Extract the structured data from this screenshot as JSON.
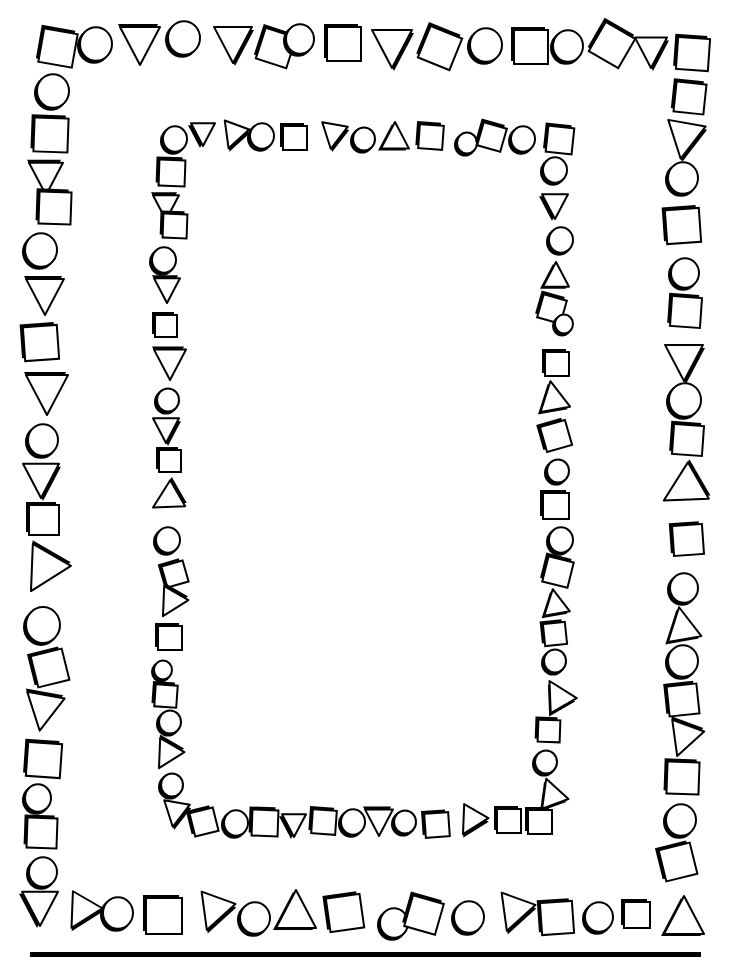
{
  "colors": {
    "ink": "#000000",
    "paper": "#ffffff"
  },
  "bottom_rule": {
    "x1": 30,
    "x2": 701,
    "y": 954,
    "thickness": 5
  },
  "outer_border": {
    "top": [
      {
        "t": "sq",
        "x": 58,
        "y": 48,
        "s": 34,
        "r": 10
      },
      {
        "t": "ci",
        "x": 96,
        "y": 44,
        "s": 34,
        "r": 0
      },
      {
        "t": "tr",
        "x": 140,
        "y": 45,
        "s": 40,
        "r": 90
      },
      {
        "t": "ci",
        "x": 184,
        "y": 38,
        "s": 34,
        "r": 0
      },
      {
        "t": "tl",
        "x": 233,
        "y": 44,
        "s": 38,
        "r": -90
      },
      {
        "t": "sq",
        "x": 276,
        "y": 48,
        "s": 32,
        "r": 18
      },
      {
        "t": "ci",
        "x": 300,
        "y": 39,
        "s": 30,
        "r": 0
      },
      {
        "t": "sq",
        "x": 344,
        "y": 44,
        "s": 34,
        "r": 0
      },
      {
        "t": "tl",
        "x": 392,
        "y": 48,
        "s": 40,
        "r": -90
      },
      {
        "t": "sq",
        "x": 440,
        "y": 48,
        "s": 34,
        "r": 22
      },
      {
        "t": "ci",
        "x": 486,
        "y": 45,
        "s": 34,
        "r": 0
      },
      {
        "t": "sq",
        "x": 531,
        "y": 47,
        "s": 34,
        "r": 0
      },
      {
        "t": "ci",
        "x": 568,
        "y": 46,
        "s": 32,
        "r": 0
      },
      {
        "t": "sq",
        "x": 612,
        "y": 45,
        "s": 34,
        "r": 30
      },
      {
        "t": "tl",
        "x": 651,
        "y": 52,
        "s": 32,
        "r": -90
      },
      {
        "t": "sq",
        "x": 693,
        "y": 54,
        "s": 32,
        "r": 4
      }
    ],
    "left": [
      {
        "t": "ci",
        "x": 53,
        "y": 91,
        "s": 34
      },
      {
        "t": "sq",
        "x": 51,
        "y": 135,
        "s": 34,
        "r": 2
      },
      {
        "t": "tr",
        "x": 46,
        "y": 178,
        "s": 34,
        "r": 90
      },
      {
        "t": "sq",
        "x": 55,
        "y": 208,
        "s": 32,
        "r": 2
      },
      {
        "t": "ci",
        "x": 41,
        "y": 250,
        "s": 34
      },
      {
        "t": "tr",
        "x": 45,
        "y": 296,
        "s": 38,
        "r": 90
      },
      {
        "t": "sq",
        "x": 41,
        "y": 343,
        "s": 34,
        "r": -4
      },
      {
        "t": "tr",
        "x": 47,
        "y": 394,
        "s": 42,
        "r": 90
      },
      {
        "t": "ci",
        "x": 43,
        "y": 440,
        "s": 32
      },
      {
        "t": "tl",
        "x": 41,
        "y": 480,
        "s": 36,
        "r": -90
      },
      {
        "t": "sq",
        "x": 44,
        "y": 520,
        "s": 30,
        "r": 0
      },
      {
        "t": "tr",
        "x": 42,
        "y": 572,
        "s": 44,
        "r": 120
      },
      {
        "t": "ci",
        "x": 43,
        "y": 625,
        "s": 36
      },
      {
        "t": "sq",
        "x": 50,
        "y": 668,
        "s": 32,
        "r": -14
      },
      {
        "t": "tr",
        "x": 43,
        "y": 712,
        "s": 38,
        "r": 100
      },
      {
        "t": "sq",
        "x": 44,
        "y": 760,
        "s": 34,
        "r": 4
      },
      {
        "t": "ci",
        "x": 38,
        "y": 798,
        "s": 28
      },
      {
        "t": "sq",
        "x": 42,
        "y": 833,
        "s": 30,
        "r": 2
      },
      {
        "t": "ci",
        "x": 43,
        "y": 872,
        "s": 30
      }
    ],
    "right": [
      {
        "t": "sq",
        "x": 690,
        "y": 98,
        "s": 30,
        "r": 6
      },
      {
        "t": "tl",
        "x": 684,
        "y": 140,
        "s": 38,
        "r": -80
      },
      {
        "t": "ci",
        "x": 683,
        "y": 178,
        "s": 32
      },
      {
        "t": "sq",
        "x": 683,
        "y": 226,
        "s": 34,
        "r": -4
      },
      {
        "t": "ci",
        "x": 685,
        "y": 273,
        "s": 30
      },
      {
        "t": "sq",
        "x": 686,
        "y": 312,
        "s": 30,
        "r": 4
      },
      {
        "t": "tl",
        "x": 684,
        "y": 362,
        "s": 38,
        "r": -90
      },
      {
        "t": "ci",
        "x": 685,
        "y": 400,
        "s": 34
      },
      {
        "t": "sq",
        "x": 688,
        "y": 440,
        "s": 30,
        "r": 4
      },
      {
        "t": "tr",
        "x": 682,
        "y": 490,
        "s": 42,
        "r": 150
      },
      {
        "t": "sq",
        "x": 688,
        "y": 540,
        "s": 30,
        "r": -4
      },
      {
        "t": "ci",
        "x": 684,
        "y": 588,
        "s": 30
      },
      {
        "t": "tu",
        "x": 682,
        "y": 624,
        "s": 34,
        "r": -10
      },
      {
        "t": "ci",
        "x": 683,
        "y": 661,
        "s": 32
      },
      {
        "t": "sq",
        "x": 683,
        "y": 700,
        "s": 30,
        "r": -6
      },
      {
        "t": "tr",
        "x": 683,
        "y": 740,
        "s": 34,
        "r": 110
      },
      {
        "t": "sq",
        "x": 683,
        "y": 778,
        "s": 32,
        "r": 2
      },
      {
        "t": "ci",
        "x": 681,
        "y": 820,
        "s": 32
      },
      {
        "t": "sq",
        "x": 678,
        "y": 862,
        "s": 32,
        "r": -14
      }
    ],
    "bottom": [
      {
        "t": "td",
        "x": 40,
        "y": 908,
        "s": 36,
        "r": 0
      },
      {
        "t": "tl",
        "x": 80,
        "y": 913,
        "s": 34,
        "r": -60
      },
      {
        "t": "ci",
        "x": 118,
        "y": 913,
        "s": 32
      },
      {
        "t": "sq",
        "x": 164,
        "y": 916,
        "s": 36,
        "r": 0
      },
      {
        "t": "tl",
        "x": 213,
        "y": 913,
        "s": 36,
        "r": -70
      },
      {
        "t": "ci",
        "x": 255,
        "y": 918,
        "s": 32
      },
      {
        "t": "tu",
        "x": 296,
        "y": 910,
        "s": 40,
        "r": 0
      },
      {
        "t": "sq",
        "x": 345,
        "y": 913,
        "s": 34,
        "r": -8
      },
      {
        "t": "ci",
        "x": 394,
        "y": 923,
        "s": 30
      },
      {
        "t": "sq",
        "x": 424,
        "y": 915,
        "s": 32,
        "r": 16
      },
      {
        "t": "ci",
        "x": 469,
        "y": 917,
        "s": 32
      },
      {
        "t": "tl",
        "x": 513,
        "y": 914,
        "s": 36,
        "r": -70
      },
      {
        "t": "sq",
        "x": 557,
        "y": 918,
        "s": 32,
        "r": -4
      },
      {
        "t": "ci",
        "x": 599,
        "y": 917,
        "s": 30
      },
      {
        "t": "sq",
        "x": 637,
        "y": 915,
        "s": 26,
        "r": 0
      },
      {
        "t": "tu",
        "x": 684,
        "y": 916,
        "s": 40,
        "r": 0
      }
    ]
  },
  "inner_border": {
    "top": [
      {
        "t": "ci",
        "x": 175,
        "y": 139,
        "s": 26
      },
      {
        "t": "td",
        "x": 203,
        "y": 134,
        "s": 24,
        "r": 0
      },
      {
        "t": "tl",
        "x": 233,
        "y": 136,
        "s": 26,
        "r": -70
      },
      {
        "t": "ci",
        "x": 262,
        "y": 136,
        "s": 26
      },
      {
        "t": "sq",
        "x": 295,
        "y": 138,
        "s": 24,
        "r": 0
      },
      {
        "t": "tl",
        "x": 333,
        "y": 136,
        "s": 26,
        "r": -80
      },
      {
        "t": "ci",
        "x": 364,
        "y": 139,
        "s": 24
      },
      {
        "t": "tu",
        "x": 395,
        "y": 136,
        "s": 28,
        "r": 0
      },
      {
        "t": "sq",
        "x": 431,
        "y": 137,
        "s": 24,
        "r": 4
      },
      {
        "t": "ci",
        "x": 467,
        "y": 143,
        "s": 22
      },
      {
        "t": "sq",
        "x": 492,
        "y": 137,
        "s": 24,
        "r": 16
      },
      {
        "t": "ci",
        "x": 523,
        "y": 139,
        "s": 26
      },
      {
        "t": "sq",
        "x": 560,
        "y": 140,
        "s": 26,
        "r": 6
      }
    ],
    "left": [
      {
        "t": "sq",
        "x": 172,
        "y": 173,
        "s": 26,
        "r": 2
      },
      {
        "t": "tr",
        "x": 166,
        "y": 207,
        "s": 26,
        "r": 90
      },
      {
        "t": "sq",
        "x": 175,
        "y": 226,
        "s": 24,
        "r": 2
      },
      {
        "t": "ci",
        "x": 164,
        "y": 260,
        "s": 26
      },
      {
        "t": "tr",
        "x": 167,
        "y": 290,
        "s": 26,
        "r": 90
      },
      {
        "t": "sq",
        "x": 166,
        "y": 326,
        "s": 22,
        "r": 0
      },
      {
        "t": "tr",
        "x": 170,
        "y": 364,
        "s": 32,
        "r": 90
      },
      {
        "t": "ci",
        "x": 168,
        "y": 400,
        "s": 24
      },
      {
        "t": "tl",
        "x": 166,
        "y": 430,
        "s": 26,
        "r": -90
      },
      {
        "t": "sq",
        "x": 170,
        "y": 461,
        "s": 22,
        "r": 0
      },
      {
        "t": "tr",
        "x": 166,
        "y": 500,
        "s": 30,
        "r": 150
      },
      {
        "t": "ci",
        "x": 168,
        "y": 540,
        "s": 26
      },
      {
        "t": "sq",
        "x": 175,
        "y": 574,
        "s": 22,
        "r": -16
      },
      {
        "t": "tr",
        "x": 170,
        "y": 604,
        "s": 28,
        "r": 120
      },
      {
        "t": "sq",
        "x": 170,
        "y": 638,
        "s": 24,
        "r": 0
      },
      {
        "t": "ci",
        "x": 163,
        "y": 670,
        "s": 20
      },
      {
        "t": "sq",
        "x": 166,
        "y": 696,
        "s": 22,
        "r": 4
      },
      {
        "t": "ci",
        "x": 170,
        "y": 722,
        "s": 24
      },
      {
        "t": "tr",
        "x": 166,
        "y": 756,
        "s": 28,
        "r": 120
      },
      {
        "t": "ci",
        "x": 172,
        "y": 785,
        "s": 24
      }
    ],
    "right": [
      {
        "t": "ci",
        "x": 555,
        "y": 170,
        "s": 26
      },
      {
        "t": "td",
        "x": 555,
        "y": 206,
        "s": 26,
        "r": 0
      },
      {
        "t": "ci",
        "x": 561,
        "y": 240,
        "s": 26
      },
      {
        "t": "tu",
        "x": 556,
        "y": 275,
        "s": 26,
        "r": 0
      },
      {
        "t": "sq",
        "x": 552,
        "y": 309,
        "s": 24,
        "r": 16
      },
      {
        "t": "ci",
        "x": 564,
        "y": 324,
        "s": 20
      },
      {
        "t": "sq",
        "x": 557,
        "y": 364,
        "s": 24,
        "r": 0
      },
      {
        "t": "tu",
        "x": 553,
        "y": 396,
        "s": 30,
        "r": -10
      },
      {
        "t": "sq",
        "x": 556,
        "y": 436,
        "s": 26,
        "r": -16
      },
      {
        "t": "ci",
        "x": 558,
        "y": 471,
        "s": 24
      },
      {
        "t": "sq",
        "x": 556,
        "y": 506,
        "s": 26,
        "r": 0
      },
      {
        "t": "ci",
        "x": 561,
        "y": 540,
        "s": 26
      },
      {
        "t": "sq",
        "x": 558,
        "y": 572,
        "s": 26,
        "r": 14
      },
      {
        "t": "tu",
        "x": 555,
        "y": 602,
        "s": 26,
        "r": -10
      },
      {
        "t": "sq",
        "x": 555,
        "y": 634,
        "s": 22,
        "r": -6
      },
      {
        "t": "ci",
        "x": 555,
        "y": 661,
        "s": 24
      },
      {
        "t": "tu",
        "x": 557,
        "y": 694,
        "s": 30,
        "r": -30
      },
      {
        "t": "sq",
        "x": 549,
        "y": 731,
        "s": 22,
        "r": 2
      },
      {
        "t": "ci",
        "x": 546,
        "y": 762,
        "s": 24
      },
      {
        "t": "tu",
        "x": 551,
        "y": 792,
        "s": 28,
        "r": -20
      }
    ],
    "bottom": [
      {
        "t": "tl",
        "x": 175,
        "y": 814,
        "s": 26,
        "r": -80
      },
      {
        "t": "sq",
        "x": 204,
        "y": 822,
        "s": 24,
        "r": -14
      },
      {
        "t": "ci",
        "x": 236,
        "y": 823,
        "s": 26
      },
      {
        "t": "sq",
        "x": 265,
        "y": 823,
        "s": 26,
        "r": 2
      },
      {
        "t": "td",
        "x": 294,
        "y": 825,
        "s": 24,
        "r": 0
      },
      {
        "t": "sq",
        "x": 324,
        "y": 822,
        "s": 24,
        "r": 4
      },
      {
        "t": "ci",
        "x": 353,
        "y": 822,
        "s": 26
      },
      {
        "t": "tr",
        "x": 379,
        "y": 822,
        "s": 28,
        "r": 90
      },
      {
        "t": "ci",
        "x": 405,
        "y": 822,
        "s": 24
      },
      {
        "t": "sq",
        "x": 437,
        "y": 825,
        "s": 24,
        "r": -4
      },
      {
        "t": "tl",
        "x": 470,
        "y": 822,
        "s": 28,
        "r": -60
      },
      {
        "t": "sq",
        "x": 509,
        "y": 821,
        "s": 24,
        "r": 0
      },
      {
        "t": "sq",
        "x": 540,
        "y": 822,
        "s": 24,
        "r": 0
      }
    ]
  }
}
